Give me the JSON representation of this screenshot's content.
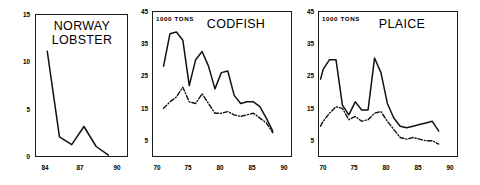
{
  "figure": {
    "width": 480,
    "height": 185,
    "background": "#ffffff",
    "line_color": "#111111"
  },
  "chart_data": [
    {
      "type": "line",
      "title": "NORWAY\nLOBSTER",
      "xlabel": "",
      "ylabel": "",
      "units_note": "",
      "xlim": [
        83.0,
        90.6
      ],
      "ylim": [
        0,
        15
      ],
      "xticks": [
        84,
        87,
        90
      ],
      "yticks": [
        0,
        5,
        10,
        15
      ],
      "grid": false,
      "legend": "none",
      "series": [
        {
          "name": "landings",
          "style": "solid",
          "x": [
            84,
            85,
            86,
            87,
            88,
            89
          ],
          "values": [
            11.1,
            2.1,
            1.3,
            3.2,
            1.1,
            0.2
          ]
        }
      ]
    },
    {
      "type": "line",
      "title": "CODFISH",
      "xlabel": "",
      "ylabel": "",
      "units_note": "1000 TONS",
      "xlim": [
        69.2,
        91.0
      ],
      "ylim": [
        0,
        45
      ],
      "xticks": [
        70,
        75,
        80,
        85,
        90
      ],
      "yticks": [
        5,
        15,
        25,
        35,
        45
      ],
      "grid": false,
      "legend": "none",
      "series": [
        {
          "name": "series-solid",
          "style": "solid",
          "x": [
            71,
            72,
            73,
            74,
            75,
            76,
            77,
            78,
            79,
            80,
            81,
            82,
            83,
            84,
            85,
            86,
            87,
            88
          ],
          "values": [
            28,
            38,
            38.5,
            36,
            22,
            30,
            32.5,
            28,
            21,
            26,
            26.5,
            19,
            16.5,
            17,
            17,
            15.5,
            12,
            8
          ]
        },
        {
          "name": "series-dashdot",
          "style": "dash-dot",
          "x": [
            71,
            72,
            73,
            74,
            75,
            76,
            77,
            78,
            79,
            80,
            81,
            82,
            83,
            84,
            85,
            86,
            87,
            88
          ],
          "values": [
            15,
            17,
            18.5,
            21.5,
            17,
            16.5,
            19.5,
            16.5,
            13.5,
            13.5,
            14,
            13,
            12.5,
            13,
            13.5,
            12,
            10.5,
            7.5
          ]
        }
      ]
    },
    {
      "type": "line",
      "title": "PLAICE",
      "xlabel": "",
      "ylabel": "",
      "units_note": "1000 TONS",
      "xlim": [
        69.2,
        91.0
      ],
      "ylim": [
        0,
        45
      ],
      "xticks": [
        70,
        75,
        80,
        85,
        90
      ],
      "yticks": [
        5,
        15,
        25,
        35,
        45
      ],
      "grid": false,
      "legend": "none",
      "series": [
        {
          "name": "series-solid",
          "style": "solid",
          "x": [
            69.6,
            70,
            71,
            72,
            73,
            74,
            75,
            76,
            77,
            78,
            79,
            80,
            81,
            82,
            83,
            84,
            85,
            86,
            87,
            88
          ],
          "values": [
            24,
            27,
            30,
            30,
            16,
            13,
            17,
            14.5,
            14.5,
            30.5,
            26,
            16.5,
            12,
            9.5,
            9,
            9.5,
            10,
            10.5,
            11,
            8
          ]
        },
        {
          "name": "series-dashdot",
          "style": "dash-dot",
          "x": [
            69.6,
            70,
            71,
            72,
            73,
            74,
            75,
            76,
            77,
            78,
            79,
            80,
            81,
            82,
            83,
            84,
            85,
            86,
            87,
            88
          ],
          "values": [
            9.5,
            11,
            13.5,
            15.5,
            15,
            11.5,
            12.5,
            11,
            11.5,
            13.5,
            14,
            11,
            8.5,
            6,
            5.5,
            6,
            5.5,
            5,
            5,
            4
          ]
        }
      ]
    }
  ],
  "panels": [
    {
      "id": "norway-lobster",
      "title_lines": "NORWAY\nLOBSTER",
      "units_note": "",
      "ytick_labels": [
        "15",
        "10",
        "5",
        "0"
      ],
      "xtick_labels": [
        "84",
        "87",
        "90"
      ]
    },
    {
      "id": "codfish",
      "title_lines": "CODFISH",
      "units_note": "1000 TONS",
      "ytick_labels": [
        "45",
        "35",
        "25",
        "15",
        "5"
      ],
      "xtick_labels": [
        "70",
        "75",
        "80",
        "85",
        "90"
      ]
    },
    {
      "id": "plaice",
      "title_lines": "PLAICE",
      "units_note": "1000 TONS",
      "ytick_labels": [
        "45",
        "35",
        "25",
        "15",
        "5"
      ],
      "xtick_labels": [
        "70",
        "75",
        "80",
        "85",
        "90"
      ]
    }
  ]
}
